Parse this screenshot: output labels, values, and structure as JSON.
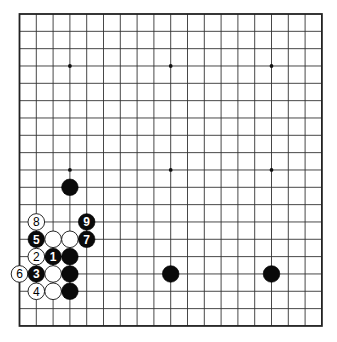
{
  "board": {
    "size": 19,
    "origin_x": 19.5,
    "origin_y": 14,
    "spacing_x": 16.8,
    "spacing_y": 17.33,
    "line_color": "#333333",
    "background": "#ffffff",
    "star_points": [
      [
        3,
        3
      ],
      [
        9,
        3
      ],
      [
        15,
        3
      ],
      [
        3,
        9
      ],
      [
        9,
        9
      ],
      [
        15,
        9
      ],
      [
        3,
        15
      ],
      [
        9,
        15
      ],
      [
        15,
        15
      ]
    ]
  },
  "stones": [
    {
      "col": 3,
      "row": 10,
      "color": "black",
      "label": ""
    },
    {
      "col": 9,
      "row": 15,
      "color": "black",
      "label": ""
    },
    {
      "col": 15,
      "row": 15,
      "color": "black",
      "label": ""
    },
    {
      "col": 1,
      "row": 12,
      "color": "white",
      "label": "8"
    },
    {
      "col": 4,
      "row": 12,
      "color": "black",
      "label": "9"
    },
    {
      "col": 1,
      "row": 13,
      "color": "black",
      "label": "5"
    },
    {
      "col": 2,
      "row": 13,
      "color": "white",
      "label": ""
    },
    {
      "col": 3,
      "row": 13,
      "color": "white",
      "label": ""
    },
    {
      "col": 4,
      "row": 13,
      "color": "black",
      "label": "7"
    },
    {
      "col": 1,
      "row": 14,
      "color": "white",
      "label": "2"
    },
    {
      "col": 2,
      "row": 14,
      "color": "black",
      "label": "1"
    },
    {
      "col": 3,
      "row": 14,
      "color": "black",
      "label": ""
    },
    {
      "col": 0,
      "row": 15,
      "color": "white",
      "label": "6"
    },
    {
      "col": 1,
      "row": 15,
      "color": "black",
      "label": "3"
    },
    {
      "col": 2,
      "row": 15,
      "color": "white",
      "label": ""
    },
    {
      "col": 3,
      "row": 15,
      "color": "black",
      "label": ""
    },
    {
      "col": 1,
      "row": 16,
      "color": "white",
      "label": "4"
    },
    {
      "col": 2,
      "row": 16,
      "color": "white",
      "label": ""
    },
    {
      "col": 3,
      "row": 16,
      "color": "black",
      "label": ""
    }
  ]
}
